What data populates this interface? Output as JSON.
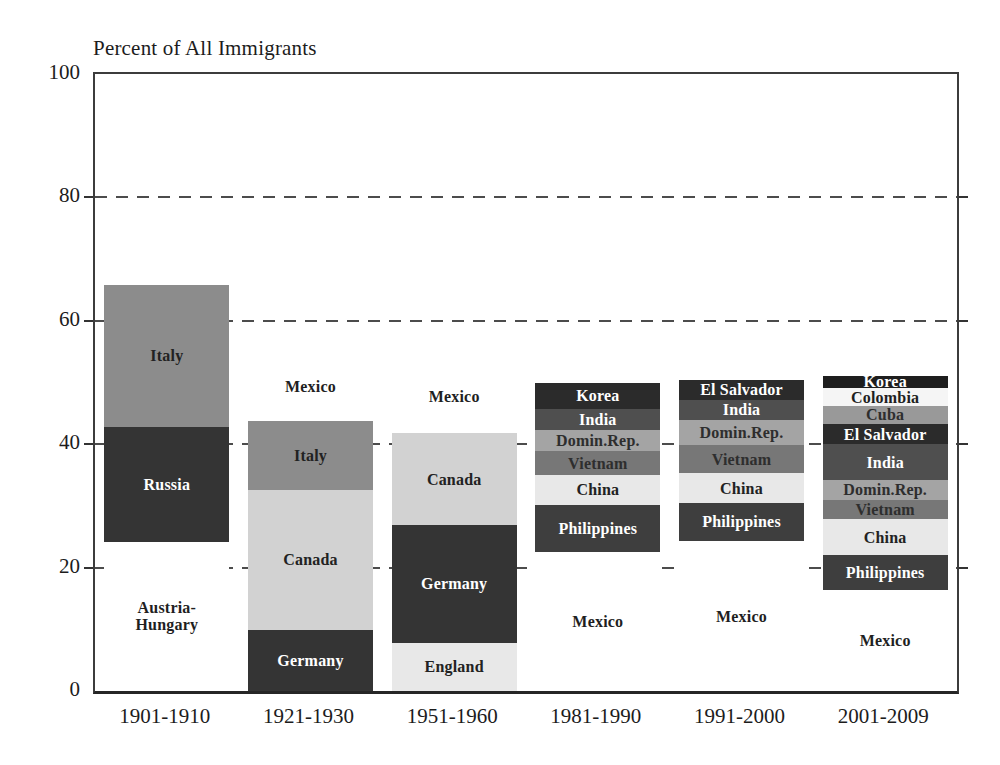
{
  "chart_data": {
    "type": "bar",
    "variant": "stacked-bar",
    "title": "Percent of All Immigrants",
    "ylim": [
      0,
      100
    ],
    "yticks": [
      0,
      20,
      40,
      60,
      80,
      100
    ],
    "gridlines": [
      20,
      40,
      60,
      80
    ],
    "grid_style": "dashed",
    "legend": "none (segments labeled in place)",
    "categories": [
      "1901-1910",
      "1921-1930",
      "1951-1960",
      "1981-1990",
      "1991-2000",
      "2001-2009"
    ],
    "bars": [
      {
        "category": "1901-1910",
        "segments": [
          {
            "label": "Austria-Hungary",
            "display": "Austria-\nHungary",
            "value": 24.2,
            "fill": "#ffffff",
            "text_color": "#1f1f1f"
          },
          {
            "label": "Russia",
            "value": 18.6,
            "fill": "#343434",
            "text_color": "#ffffff"
          },
          {
            "label": "Italy",
            "value": 23.0,
            "fill": "#8c8c8c",
            "text_color": "#222222"
          }
        ]
      },
      {
        "category": "1921-1930",
        "segments": [
          {
            "label": "Germany",
            "value": 9.9,
            "fill": "#343434",
            "text_color": "#ffffff"
          },
          {
            "label": "Canada",
            "value": 22.7,
            "fill": "#d2d2d2",
            "text_color": "#222222"
          },
          {
            "label": "Italy",
            "value": 11.1,
            "fill": "#8c8c8c",
            "text_color": "#222222"
          },
          {
            "label": "Mexico",
            "value": 11.2,
            "fill": "#ffffff",
            "text_color": "#1f1f1f"
          }
        ]
      },
      {
        "category": "1951-1960",
        "segments": [
          {
            "label": "England",
            "value": 7.8,
            "fill": "#e8e8e8",
            "text_color": "#222222"
          },
          {
            "label": "Germany",
            "value": 19.1,
            "fill": "#343434",
            "text_color": "#ffffff"
          },
          {
            "label": "Canada",
            "value": 14.9,
            "fill": "#d2d2d2",
            "text_color": "#222222"
          },
          {
            "label": "Mexico",
            "value": 11.9,
            "fill": "#ffffff",
            "text_color": "#1f1f1f"
          }
        ]
      },
      {
        "category": "1981-1990",
        "segments": [
          {
            "label": "Mexico",
            "value": 22.6,
            "fill": "#ffffff",
            "text_color": "#1f1f1f"
          },
          {
            "label": "Philippines",
            "value": 7.6,
            "fill": "#3e3e3e",
            "text_color": "#ffffff"
          },
          {
            "label": "China",
            "value": 4.8,
            "fill": "#e8e8e8",
            "text_color": "#222222"
          },
          {
            "label": "Vietnam",
            "value": 3.9,
            "fill": "#777777",
            "text_color": "#2e2e2e"
          },
          {
            "label": "Domin.Rep.",
            "value": 3.4,
            "fill": "#a4a4a4",
            "text_color": "#2e2e2e"
          },
          {
            "label": "India",
            "value": 3.4,
            "fill": "#4f4f4f",
            "text_color": "#ffffff"
          },
          {
            "label": "Korea",
            "value": 4.3,
            "fill": "#2b2b2b",
            "text_color": "#ffffff"
          }
        ]
      },
      {
        "category": "1991-2000",
        "segments": [
          {
            "label": "Mexico",
            "value": 24.3,
            "fill": "#ffffff",
            "text_color": "#1f1f1f"
          },
          {
            "label": "Philippines",
            "value": 6.2,
            "fill": "#3e3e3e",
            "text_color": "#ffffff"
          },
          {
            "label": "China",
            "value": 4.8,
            "fill": "#e8e8e8",
            "text_color": "#222222"
          },
          {
            "label": "Vietnam",
            "value": 4.6,
            "fill": "#777777",
            "text_color": "#2e2e2e"
          },
          {
            "label": "Domin.Rep.",
            "value": 4.0,
            "fill": "#a4a4a4",
            "text_color": "#2e2e2e"
          },
          {
            "label": "India",
            "value": 3.3,
            "fill": "#4f4f4f",
            "text_color": "#ffffff"
          },
          {
            "label": "El Salvador",
            "value": 3.2,
            "fill": "#2b2b2b",
            "text_color": "#ffffff"
          }
        ]
      },
      {
        "category": "2001-2009",
        "segments": [
          {
            "label": "Mexico",
            "value": 16.4,
            "fill": "#ffffff",
            "text_color": "#1f1f1f"
          },
          {
            "label": "Philippines",
            "value": 5.6,
            "fill": "#3e3e3e",
            "text_color": "#ffffff"
          },
          {
            "label": "China",
            "value": 5.9,
            "fill": "#e8e8e8",
            "text_color": "#222222"
          },
          {
            "label": "Vietnam",
            "value": 3.1,
            "fill": "#777777",
            "text_color": "#2e2e2e"
          },
          {
            "label": "Domin.Rep.",
            "value": 3.2,
            "fill": "#a4a4a4",
            "text_color": "#2e2e2e"
          },
          {
            "label": "India",
            "value": 5.8,
            "fill": "#4f4f4f",
            "text_color": "#ffffff"
          },
          {
            "label": "El Salvador",
            "value": 3.3,
            "fill": "#2b2b2b",
            "text_color": "#ffffff"
          },
          {
            "label": "Cuba",
            "value": 2.9,
            "fill": "#999999",
            "text_color": "#2e2e2e"
          },
          {
            "label": "Colombia",
            "value": 2.9,
            "fill": "#f5f5f5",
            "text_color": "#1f1f1f"
          },
          {
            "label": "Korea",
            "value": 2.0,
            "fill": "#1e1e1e",
            "text_color": "#ffffff"
          }
        ]
      }
    ],
    "colors": {
      "dark_segment": "#343434",
      "medium_gray": "#8c8c8c",
      "light_gray": "#d2d2d2",
      "very_light_gray": "#e8e8e8",
      "axis": "#3c3c3c",
      "text": "#1c1c1c"
    }
  }
}
